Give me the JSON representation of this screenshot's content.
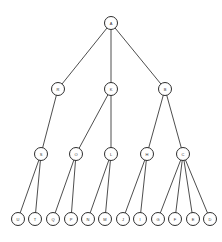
{
  "diagram": {
    "type": "tree",
    "nodes": [
      {
        "id": "A",
        "label": "A",
        "level": 0
      },
      {
        "id": "R",
        "label": "R",
        "level": 1
      },
      {
        "id": "K",
        "label": "K",
        "level": 1
      },
      {
        "id": "B",
        "label": "B",
        "level": 1
      },
      {
        "id": "S",
        "label": "S",
        "level": 2
      },
      {
        "id": "O",
        "label": "O",
        "level": 2
      },
      {
        "id": "L",
        "label": "L",
        "level": 2
      },
      {
        "id": "H",
        "label": "H",
        "level": 2
      },
      {
        "id": "C",
        "label": "C",
        "level": 2
      },
      {
        "id": "U",
        "label": "U",
        "level": 3
      },
      {
        "id": "T",
        "label": "T",
        "level": 3
      },
      {
        "id": "Q",
        "label": "Q",
        "level": 3
      },
      {
        "id": "P",
        "label": "P",
        "level": 3
      },
      {
        "id": "N",
        "label": "N",
        "level": 3
      },
      {
        "id": "M",
        "label": "M",
        "level": 3
      },
      {
        "id": "J",
        "label": "J",
        "level": 3
      },
      {
        "id": "I",
        "label": "I",
        "level": 3
      },
      {
        "id": "G",
        "label": "G",
        "level": 3
      },
      {
        "id": "F",
        "label": "F",
        "level": 3
      },
      {
        "id": "E",
        "label": "E",
        "level": 3
      },
      {
        "id": "D",
        "label": "D",
        "level": 3
      }
    ],
    "edges": [
      [
        "A",
        "R"
      ],
      [
        "A",
        "K"
      ],
      [
        "A",
        "B"
      ],
      [
        "R",
        "S"
      ],
      [
        "K",
        "O"
      ],
      [
        "K",
        "L"
      ],
      [
        "B",
        "H"
      ],
      [
        "B",
        "C"
      ],
      [
        "S",
        "U"
      ],
      [
        "S",
        "T"
      ],
      [
        "O",
        "Q"
      ],
      [
        "O",
        "P"
      ],
      [
        "L",
        "N"
      ],
      [
        "L",
        "M"
      ],
      [
        "H",
        "J"
      ],
      [
        "H",
        "I"
      ],
      [
        "C",
        "G"
      ],
      [
        "C",
        "F"
      ],
      [
        "C",
        "E"
      ],
      [
        "C",
        "D"
      ]
    ]
  }
}
